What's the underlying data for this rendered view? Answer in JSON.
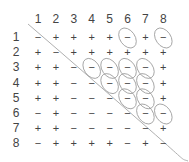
{
  "matrix": {
    "column_labels": [
      "1",
      "2",
      "3",
      "4",
      "5",
      "6",
      "7",
      "8"
    ],
    "row_labels": [
      "1",
      "2",
      "3",
      "4",
      "5",
      "6",
      "7",
      "8"
    ],
    "rows": [
      [
        "−",
        "+",
        "+",
        "+",
        "+",
        "−",
        "+",
        "−"
      ],
      [
        "+",
        "−",
        "+",
        "+",
        "+",
        "+",
        "+",
        "+"
      ],
      [
        "+",
        "+",
        "−",
        "−",
        "−",
        "−",
        "−",
        "+"
      ],
      [
        "+",
        "+",
        "−",
        "−",
        "−",
        "−",
        "−",
        "+"
      ],
      [
        "+",
        "+",
        "−",
        "−",
        "−",
        "−",
        "−",
        "+"
      ],
      [
        "−",
        "+",
        "−",
        "−",
        "−",
        "−",
        "−",
        "−"
      ],
      [
        "+",
        "+",
        "−",
        "−",
        "−",
        "−",
        "−",
        "+"
      ],
      [
        "−",
        "+",
        "+",
        "+",
        "+",
        "−",
        "+",
        "−"
      ]
    ],
    "circled_cells": [
      [
        1,
        6
      ],
      [
        1,
        8
      ],
      [
        3,
        4
      ],
      [
        3,
        5
      ],
      [
        3,
        6
      ],
      [
        3,
        7
      ],
      [
        4,
        5
      ],
      [
        4,
        6
      ],
      [
        4,
        7
      ],
      [
        5,
        6
      ],
      [
        5,
        7
      ],
      [
        6,
        7
      ],
      [
        6,
        8
      ]
    ]
  },
  "colors": {
    "text": "#444444",
    "ellipse": "#9a9a9a",
    "diagonal": "#b0b0b0"
  }
}
